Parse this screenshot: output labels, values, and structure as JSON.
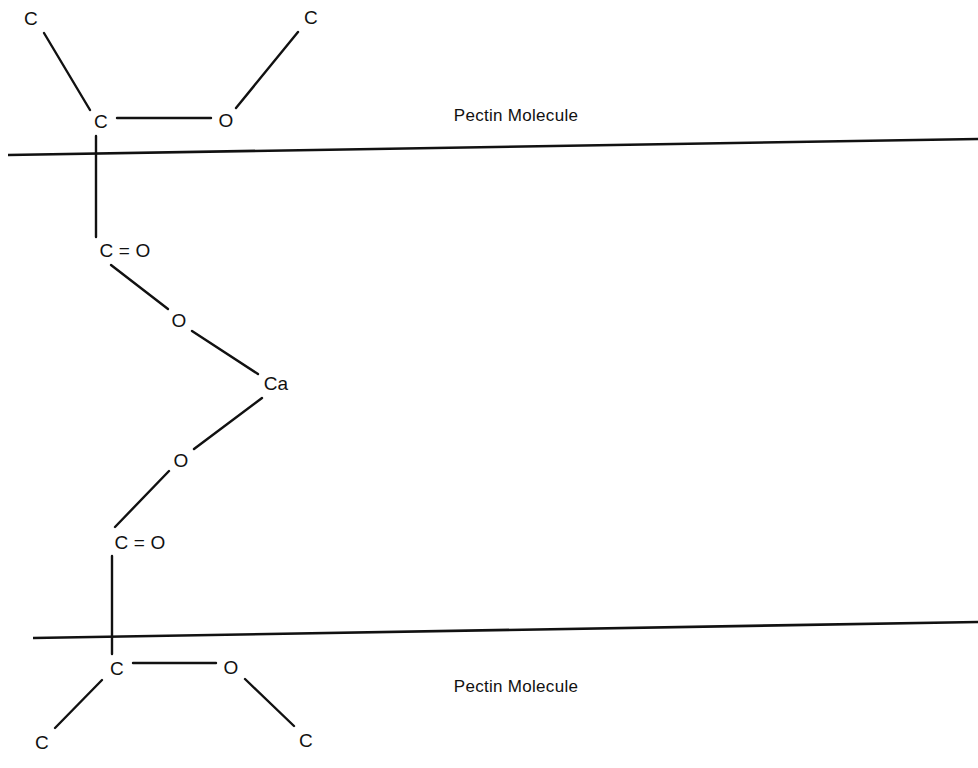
{
  "diagram": {
    "type": "chemical-structure",
    "canvas": {
      "width": 978,
      "height": 768
    },
    "colors": {
      "ink": "#111111",
      "background": "#ffffff"
    },
    "backbones": [
      {
        "name": "pectin-backbone-top",
        "label": "Pectin Molecule",
        "label_x": 516,
        "label_y": 115,
        "x1": 8,
        "y1": 155,
        "x2": 978,
        "y2": 139
      },
      {
        "name": "pectin-backbone-bottom",
        "label": "Pectin Molecule",
        "label_x": 516,
        "label_y": 686,
        "x1": 33,
        "y1": 638,
        "x2": 978,
        "y2": 622
      }
    ],
    "atoms": [
      {
        "id": "c-top-left",
        "text": "C",
        "x": 31,
        "y": 18,
        "cls": "atom-label"
      },
      {
        "id": "c-top-right",
        "text": "C",
        "x": 311,
        "y": 17,
        "cls": "atom-label"
      },
      {
        "id": "c-top-ester",
        "text": "C",
        "x": 101,
        "y": 121,
        "cls": "atom-label"
      },
      {
        "id": "o-top-ester",
        "text": "O",
        "x": 226,
        "y": 120,
        "cls": "atom-label"
      },
      {
        "id": "carbonyl-top",
        "text": "C = O",
        "x": 125,
        "y": 250,
        "cls": "atom-label carbonyl-label"
      },
      {
        "id": "o-upper-bridge",
        "text": "O",
        "x": 179,
        "y": 320,
        "cls": "atom-label"
      },
      {
        "id": "ca-center",
        "text": "Ca",
        "x": 276,
        "y": 383,
        "cls": "atom-label"
      },
      {
        "id": "o-lower-bridge",
        "text": "O",
        "x": 181,
        "y": 460,
        "cls": "atom-label"
      },
      {
        "id": "carbonyl-bottom",
        "text": "C = O",
        "x": 140,
        "y": 542,
        "cls": "atom-label carbonyl-label"
      },
      {
        "id": "c-bottom-ester",
        "text": "C",
        "x": 117,
        "y": 668,
        "cls": "atom-label"
      },
      {
        "id": "o-bottom-ester",
        "text": "O",
        "x": 231,
        "y": 667,
        "cls": "atom-label"
      },
      {
        "id": "c-bottom-left",
        "text": "C",
        "x": 42,
        "y": 742,
        "cls": "atom-label"
      },
      {
        "id": "c-bottom-right",
        "text": "C",
        "x": 306,
        "y": 740,
        "cls": "atom-label"
      }
    ],
    "bonds": [
      {
        "id": "bond-c-topleft-to-c",
        "x1": 44,
        "y1": 33,
        "x2": 90,
        "y2": 110
      },
      {
        "id": "bond-c-topright-to-o",
        "x1": 298,
        "y1": 32,
        "x2": 236,
        "y2": 108
      },
      {
        "id": "bond-c-to-o-top",
        "x1": 117,
        "y1": 118,
        "x2": 211,
        "y2": 118
      },
      {
        "id": "bond-c-vertical-top",
        "x1": 96,
        "y1": 136,
        "x2": 96,
        "y2": 237
      },
      {
        "id": "bond-carbonyl-to-o-upper",
        "x1": 111,
        "y1": 265,
        "x2": 168,
        "y2": 309
      },
      {
        "id": "bond-o-upper-to-ca",
        "x1": 192,
        "y1": 331,
        "x2": 258,
        "y2": 374
      },
      {
        "id": "bond-ca-to-o-lower",
        "x1": 262,
        "y1": 398,
        "x2": 194,
        "y2": 449
      },
      {
        "id": "bond-o-lower-to-carbonyl",
        "x1": 169,
        "y1": 471,
        "x2": 115,
        "y2": 527
      },
      {
        "id": "bond-c-vertical-bottom",
        "x1": 112,
        "y1": 556,
        "x2": 112,
        "y2": 654
      },
      {
        "id": "bond-c-to-o-bottom",
        "x1": 133,
        "y1": 663,
        "x2": 216,
        "y2": 663
      },
      {
        "id": "bond-c-bottomleft-to-c",
        "x1": 102,
        "y1": 680,
        "x2": 55,
        "y2": 728
      },
      {
        "id": "bond-o-bottomright-to-c",
        "x1": 245,
        "y1": 679,
        "x2": 294,
        "y2": 726
      }
    ]
  }
}
